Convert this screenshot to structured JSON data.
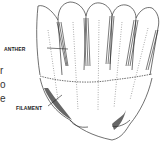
{
  "figure": {
    "labels": {
      "anther": "ANTHER",
      "filament": "FILAMENT"
    },
    "cropped_text_fragments": [
      "r",
      "o",
      "e"
    ],
    "colors": {
      "ink": "#222222",
      "background": "#ffffff"
    }
  }
}
